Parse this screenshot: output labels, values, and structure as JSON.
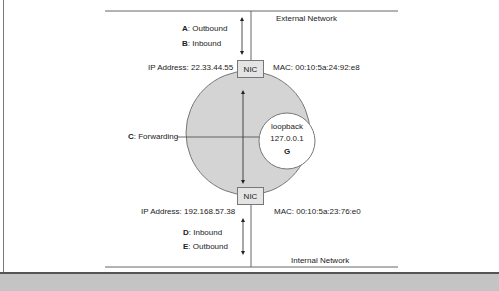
{
  "networks": {
    "external": "External Network",
    "internal": "Internal Network"
  },
  "top_interface": {
    "nic_label": "NIC",
    "ip": "IP Address: 22.33.44.55",
    "mac": "MAC: 00:10:5a:24:92:e8",
    "flows": [
      {
        "key": "A",
        "label": ": Outbound"
      },
      {
        "key": "B",
        "label": ": Inbound"
      }
    ]
  },
  "bottom_interface": {
    "nic_label": "NIC",
    "ip": "IP Address: 192.168.57.38",
    "mac": "MAC: 00:10:5a:23:76:e0",
    "flows": [
      {
        "key": "D",
        "label": ": Inbound"
      },
      {
        "key": "E",
        "label": ": Outbound"
      }
    ]
  },
  "forwarding": {
    "key": "C",
    "label": ": Forwarding"
  },
  "loopback": {
    "name": "loopback",
    "ip": "127.0.0.1",
    "key": "G"
  },
  "colors": {
    "host_fill": "#d4d4d4",
    "loopback_fill": "#ffffff",
    "nic_fill": "#e4e4e4",
    "line": "#555555",
    "band": "#c4c4c4"
  }
}
